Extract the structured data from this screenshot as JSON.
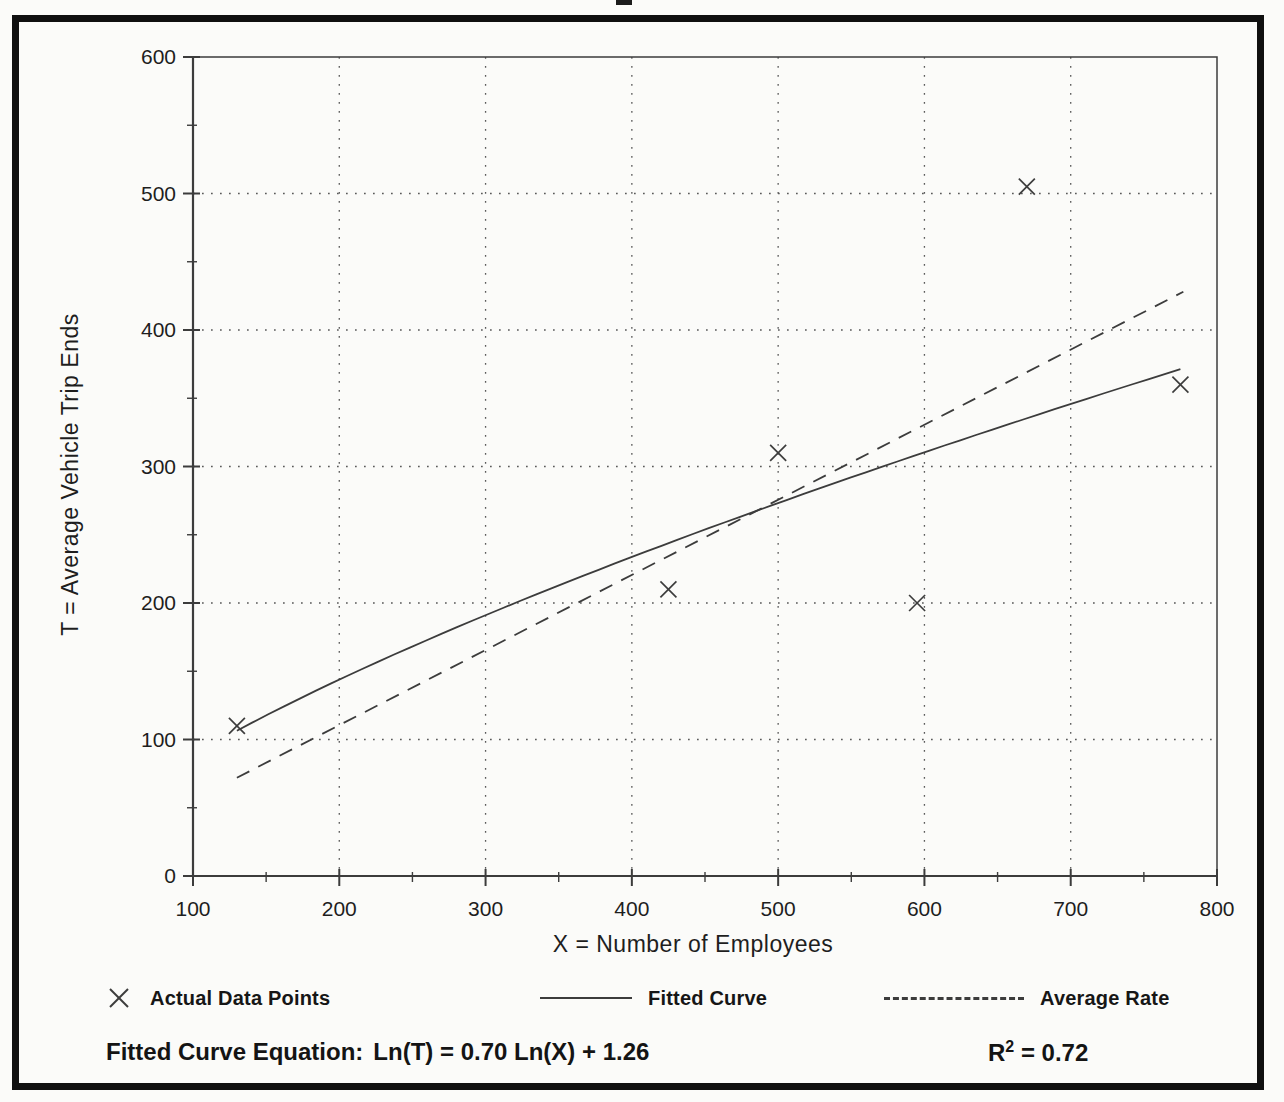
{
  "figure": {
    "background": "#fbfbf9",
    "border_color": "#101010",
    "ink": "#3c3c3c",
    "grid_color": "#5a5a5a",
    "text_color": "#1e1e1e"
  },
  "chart_data": {
    "type": "scatter",
    "title": "",
    "xlabel": "X = Number of Employees",
    "ylabel": "T = Average Vehicle Trip Ends",
    "xlim": [
      100,
      800
    ],
    "ylim": [
      0,
      600
    ],
    "x_major_ticks": [
      100,
      200,
      300,
      400,
      500,
      600,
      700,
      800
    ],
    "y_major_ticks": [
      0,
      100,
      200,
      300,
      400,
      500,
      600
    ],
    "minor_tick_step": 50,
    "grid": "dotted lines at every 100 units on both axes",
    "legend_position": "below plot",
    "series": [
      {
        "name": "Actual Data Points",
        "kind": "scatter",
        "marker": "x",
        "points": [
          [
            130,
            110
          ],
          [
            425,
            210
          ],
          [
            500,
            310
          ],
          [
            595,
            200
          ],
          [
            670,
            505
          ],
          [
            775,
            360
          ]
        ]
      },
      {
        "name": "Fitted Curve",
        "kind": "power-curve",
        "equation": "Ln(T) = 0.70 Ln(X) + 1.26",
        "ln_intercept": 1.26,
        "exponent": 0.7,
        "x_range": [
          130,
          775
        ]
      },
      {
        "name": "Average Rate",
        "kind": "dashed-line",
        "rate": 0.55,
        "points": [
          [
            130,
            72
          ],
          [
            777,
            428
          ]
        ]
      }
    ]
  },
  "legend": {
    "items": [
      {
        "icon": "x-marker",
        "label": "Actual Data Points"
      },
      {
        "icon": "solid-line",
        "label": "Fitted Curve"
      },
      {
        "icon": "dashed-line",
        "label": "Average Rate"
      }
    ]
  },
  "annotations": {
    "equation_label": "Fitted Curve Equation:",
    "equation_value": "Ln(T) = 0.70 Ln(X) + 1.26",
    "r2_base": "R",
    "r2_sup": "2",
    "r2_rest": " = 0.72"
  }
}
